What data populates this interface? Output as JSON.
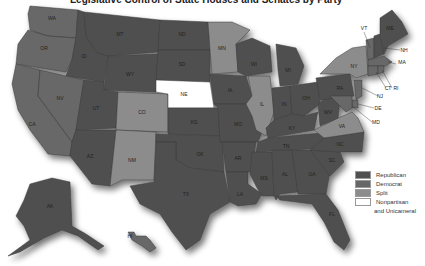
{
  "title": "Legislative Control of State Houses and Senates by Party",
  "colors": {
    "republican": "#505050",
    "democrat": "#676767",
    "split": "#8c8c8c",
    "nonpartisan": "#ffffff"
  },
  "legend": {
    "items": [
      {
        "label": "Republican",
        "key": "republican"
      },
      {
        "label": "Democrat",
        "key": "democrat"
      },
      {
        "label": "Split",
        "key": "split"
      },
      {
        "label": "Nonpartisan",
        "key": "nonpartisan",
        "sub": "and Unicameral"
      }
    ]
  },
  "states": [
    {
      "abbr": "WA",
      "control": "democrat"
    },
    {
      "abbr": "OR",
      "control": "democrat"
    },
    {
      "abbr": "CA",
      "control": "democrat"
    },
    {
      "abbr": "ID",
      "control": "republican"
    },
    {
      "abbr": "NV",
      "control": "democrat"
    },
    {
      "abbr": "MT",
      "control": "republican"
    },
    {
      "abbr": "WY",
      "control": "republican"
    },
    {
      "abbr": "UT",
      "control": "republican"
    },
    {
      "abbr": "CO",
      "control": "split"
    },
    {
      "abbr": "AZ",
      "control": "republican"
    },
    {
      "abbr": "NM",
      "control": "split"
    },
    {
      "abbr": "ND",
      "control": "republican"
    },
    {
      "abbr": "SD",
      "control": "republican"
    },
    {
      "abbr": "NE",
      "control": "nonpartisan"
    },
    {
      "abbr": "KS",
      "control": "republican"
    },
    {
      "abbr": "OK",
      "control": "republican"
    },
    {
      "abbr": "TX",
      "control": "republican"
    },
    {
      "abbr": "MN",
      "control": "split"
    },
    {
      "abbr": "IA",
      "control": "republican"
    },
    {
      "abbr": "MO",
      "control": "republican"
    },
    {
      "abbr": "AR",
      "control": "republican"
    },
    {
      "abbr": "LA",
      "control": "republican"
    },
    {
      "abbr": "WI",
      "control": "republican"
    },
    {
      "abbr": "IL",
      "control": "split"
    },
    {
      "abbr": "MI",
      "control": "republican"
    },
    {
      "abbr": "IN",
      "control": "republican"
    },
    {
      "abbr": "OH",
      "control": "republican"
    },
    {
      "abbr": "KY",
      "control": "republican"
    },
    {
      "abbr": "TN",
      "control": "republican"
    },
    {
      "abbr": "MS",
      "control": "republican"
    },
    {
      "abbr": "AL",
      "control": "republican"
    },
    {
      "abbr": "GA",
      "control": "republican"
    },
    {
      "abbr": "FL",
      "control": "republican"
    },
    {
      "abbr": "SC",
      "control": "republican"
    },
    {
      "abbr": "NC",
      "control": "republican"
    },
    {
      "abbr": "VA",
      "control": "split"
    },
    {
      "abbr": "WV",
      "control": "republican"
    },
    {
      "abbr": "PA",
      "control": "republican"
    },
    {
      "abbr": "NY",
      "control": "split"
    },
    {
      "abbr": "VT",
      "control": "democrat"
    },
    {
      "abbr": "NH",
      "control": "republican"
    },
    {
      "abbr": "ME",
      "control": "republican"
    },
    {
      "abbr": "MA",
      "control": "democrat"
    },
    {
      "abbr": "RI",
      "control": "democrat"
    },
    {
      "abbr": "CT",
      "control": "democrat"
    },
    {
      "abbr": "NJ",
      "control": "democrat"
    },
    {
      "abbr": "DE",
      "control": "democrat"
    },
    {
      "abbr": "MD",
      "control": "democrat"
    },
    {
      "abbr": "AK",
      "control": "republican"
    },
    {
      "abbr": "HI",
      "control": "democrat"
    }
  ]
}
